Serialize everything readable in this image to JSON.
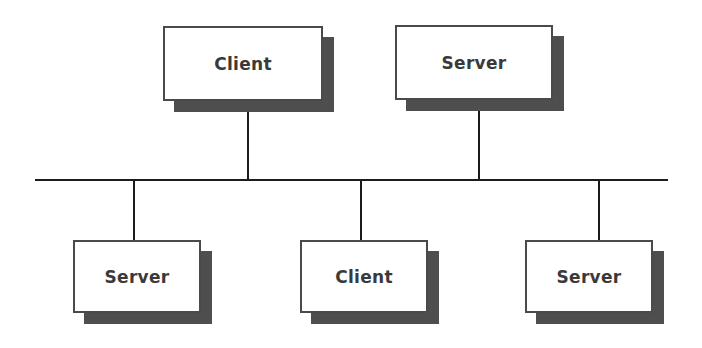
{
  "diagram": {
    "type": "network-topology",
    "background_color": "#ffffff",
    "canvas": {
      "width": 702,
      "height": 348
    },
    "style": {
      "box_fill": "#ffffff",
      "box_border_color": "#4a4a4a",
      "shadow_color": "#4e4e4e",
      "shadow_offset": 11,
      "line_color": "#1c1c1c",
      "label_color": "#3a3a3a"
    },
    "nodes": [
      {
        "id": "node-top-client",
        "label": "Client",
        "role": "client",
        "position": "top-left",
        "x": 163,
        "y": 26,
        "width": 160,
        "height": 75
      },
      {
        "id": "node-top-server",
        "label": "Server",
        "role": "server",
        "position": "top-right",
        "x": 395,
        "y": 25,
        "width": 158,
        "height": 75
      },
      {
        "id": "node-bottom-server-left",
        "label": "Server",
        "role": "server",
        "position": "bottom-left",
        "x": 73,
        "y": 240,
        "width": 128,
        "height": 73
      },
      {
        "id": "node-bottom-client",
        "label": "Client",
        "role": "client",
        "position": "bottom-center",
        "x": 300,
        "y": 240,
        "width": 128,
        "height": 73
      },
      {
        "id": "node-bottom-server-right",
        "label": "Server",
        "role": "server",
        "position": "bottom-right",
        "x": 525,
        "y": 240,
        "width": 128,
        "height": 73
      }
    ],
    "bus": {
      "id": "backbone-bus",
      "label": "",
      "x1": 35,
      "x2": 668,
      "y": 179,
      "thickness": 2
    },
    "links": [
      {
        "id": "link-top-client",
        "from": "node-top-client",
        "to": "backbone-bus",
        "x": 247,
        "y1": 112,
        "y2": 181
      },
      {
        "id": "link-top-server",
        "from": "node-top-server",
        "to": "backbone-bus",
        "x": 478,
        "y1": 111,
        "y2": 181
      },
      {
        "id": "link-bottom-server-left",
        "from": "backbone-bus",
        "to": "node-bottom-server-left",
        "x": 133,
        "y1": 179,
        "y2": 241
      },
      {
        "id": "link-bottom-client",
        "from": "backbone-bus",
        "to": "node-bottom-client",
        "x": 360,
        "y1": 179,
        "y2": 241
      },
      {
        "id": "link-bottom-server-right",
        "from": "backbone-bus",
        "to": "node-bottom-server-right",
        "x": 598,
        "y1": 179,
        "y2": 241
      }
    ]
  }
}
